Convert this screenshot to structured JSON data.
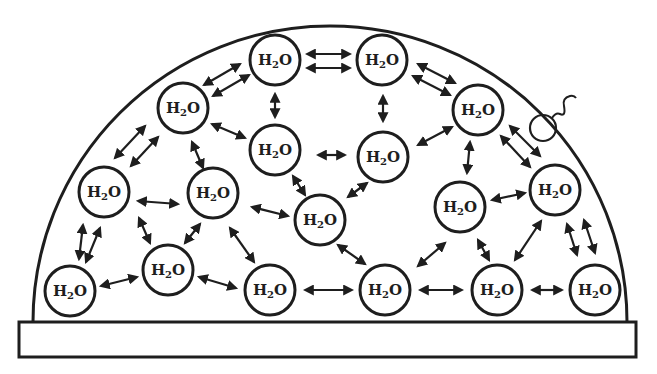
{
  "diagram": {
    "title": "",
    "molecule_label": "H2O",
    "label_main": "H",
    "label_sub": "2",
    "label_end": "O",
    "stroke_color": "#1e1e1e",
    "background": "#ffffff",
    "molecules": [
      {
        "id": "m1",
        "x": 275,
        "y": 60
      },
      {
        "id": "m2",
        "x": 382,
        "y": 60
      },
      {
        "id": "m3",
        "x": 183,
        "y": 108
      },
      {
        "id": "m4",
        "x": 478,
        "y": 110
      },
      {
        "id": "m5",
        "x": 275,
        "y": 150
      },
      {
        "id": "m6",
        "x": 383,
        "y": 157
      },
      {
        "id": "m7",
        "x": 104,
        "y": 192
      },
      {
        "id": "m8",
        "x": 213,
        "y": 193
      },
      {
        "id": "m9",
        "x": 555,
        "y": 190
      },
      {
        "id": "m10",
        "x": 320,
        "y": 220
      },
      {
        "id": "m11",
        "x": 460,
        "y": 207
      },
      {
        "id": "m12",
        "x": 70,
        "y": 291
      },
      {
        "id": "m13",
        "x": 168,
        "y": 270
      },
      {
        "id": "m14",
        "x": 270,
        "y": 290
      },
      {
        "id": "m15",
        "x": 385,
        "y": 290
      },
      {
        "id": "m16",
        "x": 497,
        "y": 290
      },
      {
        "id": "m17",
        "x": 595,
        "y": 290
      }
    ],
    "arrows": [
      {
        "x1": 307,
        "y1": 54,
        "x2": 350,
        "y2": 54
      },
      {
        "x1": 307,
        "y1": 68,
        "x2": 350,
        "y2": 68
      },
      {
        "x1": 204,
        "y1": 85,
        "x2": 240,
        "y2": 64
      },
      {
        "x1": 213,
        "y1": 96,
        "x2": 249,
        "y2": 75
      },
      {
        "x1": 418,
        "y1": 64,
        "x2": 455,
        "y2": 83
      },
      {
        "x1": 413,
        "y1": 76,
        "x2": 450,
        "y2": 95
      },
      {
        "x1": 275,
        "y1": 94,
        "x2": 275,
        "y2": 117
      },
      {
        "x1": 383,
        "y1": 96,
        "x2": 383,
        "y2": 121
      },
      {
        "x1": 115,
        "y1": 158,
        "x2": 145,
        "y2": 126
      },
      {
        "x1": 131,
        "y1": 166,
        "x2": 158,
        "y2": 137
      },
      {
        "x1": 212,
        "y1": 124,
        "x2": 245,
        "y2": 138
      },
      {
        "x1": 318,
        "y1": 155,
        "x2": 345,
        "y2": 155
      },
      {
        "x1": 418,
        "y1": 145,
        "x2": 452,
        "y2": 127
      },
      {
        "x1": 192,
        "y1": 142,
        "x2": 203,
        "y2": 168
      },
      {
        "x1": 510,
        "y1": 126,
        "x2": 540,
        "y2": 156
      },
      {
        "x1": 501,
        "y1": 136,
        "x2": 530,
        "y2": 167
      },
      {
        "x1": 470,
        "y1": 142,
        "x2": 467,
        "y2": 173
      },
      {
        "x1": 138,
        "y1": 201,
        "x2": 178,
        "y2": 204
      },
      {
        "x1": 252,
        "y1": 207,
        "x2": 288,
        "y2": 216
      },
      {
        "x1": 293,
        "y1": 176,
        "x2": 305,
        "y2": 195
      },
      {
        "x1": 348,
        "y1": 197,
        "x2": 367,
        "y2": 183
      },
      {
        "x1": 492,
        "y1": 200,
        "x2": 525,
        "y2": 193
      },
      {
        "x1": 79,
        "y1": 259,
        "x2": 83,
        "y2": 225
      },
      {
        "x1": 86,
        "y1": 262,
        "x2": 100,
        "y2": 228
      },
      {
        "x1": 139,
        "y1": 218,
        "x2": 150,
        "y2": 243
      },
      {
        "x1": 185,
        "y1": 243,
        "x2": 200,
        "y2": 224
      },
      {
        "x1": 230,
        "y1": 228,
        "x2": 254,
        "y2": 262
      },
      {
        "x1": 338,
        "y1": 245,
        "x2": 365,
        "y2": 264
      },
      {
        "x1": 445,
        "y1": 243,
        "x2": 418,
        "y2": 266
      },
      {
        "x1": 478,
        "y1": 240,
        "x2": 489,
        "y2": 260
      },
      {
        "x1": 515,
        "y1": 260,
        "x2": 541,
        "y2": 221
      },
      {
        "x1": 567,
        "y1": 224,
        "x2": 577,
        "y2": 255
      },
      {
        "x1": 584,
        "y1": 220,
        "x2": 595,
        "y2": 253
      },
      {
        "x1": 101,
        "y1": 286,
        "x2": 137,
        "y2": 277
      },
      {
        "x1": 199,
        "y1": 277,
        "x2": 236,
        "y2": 288
      },
      {
        "x1": 305,
        "y1": 290,
        "x2": 352,
        "y2": 290
      },
      {
        "x1": 420,
        "y1": 290,
        "x2": 462,
        "y2": 290
      },
      {
        "x1": 532,
        "y1": 290,
        "x2": 562,
        "y2": 290
      }
    ],
    "dome": {
      "left_x": 33,
      "right_x": 627,
      "base_y": 322,
      "top_y": 26
    },
    "base": {
      "x": 19,
      "y": 322,
      "width": 617,
      "height": 35
    },
    "escaping_molecule": {
      "x": 543,
      "y": 128,
      "r": 13
    }
  }
}
